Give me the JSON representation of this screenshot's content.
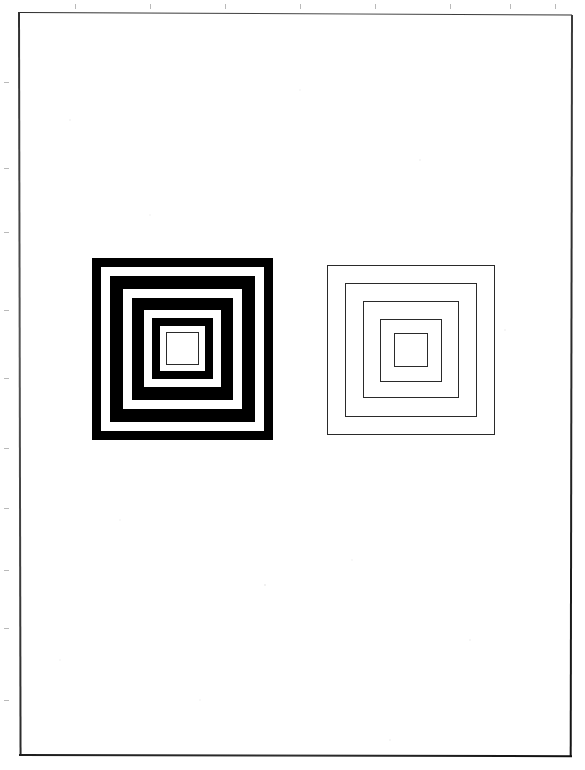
{
  "document": {
    "type": "scanned-page",
    "page_background": "#ffffff",
    "paper_color": "#ffffff",
    "edge_color": "#2b2b2b",
    "orientation": "portrait",
    "content_description": "Two concentric-square (nested square) figures side by side on a blank white page"
  },
  "page": {
    "sheet": {
      "left": 18,
      "top": 11,
      "width": 554,
      "height": 744
    },
    "tick_marks": {
      "top_positions": [
        75,
        150,
        225,
        300,
        375,
        450,
        510,
        555
      ],
      "left_positions": [
        82,
        168,
        232,
        310,
        378,
        448,
        508,
        570,
        628,
        700
      ],
      "color": "#b9b9b9"
    }
  },
  "figures": [
    {
      "id": "figure-left",
      "name": "high-contrast-nested-squares",
      "label": "Left figure",
      "description": "Concentric squares rendered as thick solid black bands alternating with white bands, innermost element a thin black outlined square",
      "style": "solid-bands",
      "fill_color": "#000000",
      "gap_color": "#ffffff",
      "ring_count": 6,
      "bounds": {
        "left": 92,
        "top": 258,
        "width": 181,
        "height": 182
      },
      "rings": [
        {
          "index": 0,
          "inset": 0,
          "size": 181,
          "kind": "solid"
        },
        {
          "index": 1,
          "inset": 9,
          "size": 163,
          "kind": "gap"
        },
        {
          "index": 2,
          "inset": 18,
          "size": 145,
          "kind": "solid"
        },
        {
          "index": 3,
          "inset": 31,
          "size": 119,
          "kind": "gap"
        },
        {
          "index": 4,
          "inset": 40,
          "size": 101,
          "kind": "solid"
        },
        {
          "index": 5,
          "inset": 52,
          "size": 77,
          "kind": "gap"
        },
        {
          "index": 6,
          "inset": 60,
          "size": 61,
          "kind": "solid"
        },
        {
          "index": 7,
          "inset": 68,
          "size": 45,
          "kind": "gap"
        },
        {
          "index": 8,
          "inset": 74,
          "size": 33,
          "kind": "outline"
        }
      ]
    },
    {
      "id": "figure-right",
      "name": "low-contrast-nested-squares",
      "label": "Right figure",
      "description": "Concentric squares rendered as thin black outlines only, no fill",
      "style": "thin-outlines",
      "stroke_color": "#2a2a2a",
      "stroke_width": 1,
      "ring_count": 5,
      "bounds": {
        "left": 327,
        "top": 265,
        "width": 168,
        "height": 170
      },
      "rings": [
        {
          "index": 0,
          "inset": 0,
          "size": 168,
          "kind": "outline"
        },
        {
          "index": 1,
          "inset": 18,
          "size": 132,
          "kind": "outline"
        },
        {
          "index": 2,
          "inset": 36,
          "size": 96,
          "kind": "outline"
        },
        {
          "index": 3,
          "inset": 53,
          "size": 62,
          "kind": "outline"
        },
        {
          "index": 4,
          "inset": 67,
          "size": 34,
          "kind": "outline"
        }
      ]
    }
  ]
}
